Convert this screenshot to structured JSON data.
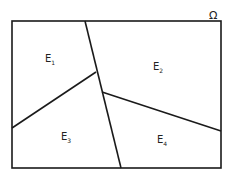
{
  "domain_label": {
    "symbol": "Ω"
  },
  "regions": [
    {
      "id": "E1",
      "letter": "E",
      "sub": "1"
    },
    {
      "id": "E2",
      "letter": "E",
      "sub": "2"
    },
    {
      "id": "E3",
      "letter": "E",
      "sub": "3"
    },
    {
      "id": "E4",
      "letter": "E",
      "sub": "4"
    }
  ],
  "colors": {
    "stroke": "#1a1a1a",
    "background": "#ffffff"
  }
}
